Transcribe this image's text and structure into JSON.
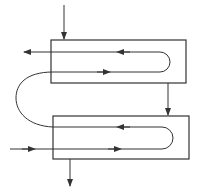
{
  "diagram": {
    "type": "two-pass U-tube heat exchanger flow schematic",
    "stroke_color": "#333333",
    "background": "#ffffff",
    "units": [
      {
        "name": "upper-exchanger-shell",
        "x": 51,
        "y": 40,
        "w": 135,
        "h": 43
      },
      {
        "name": "lower-exchanger-shell",
        "x": 53,
        "y": 116,
        "w": 136,
        "h": 43
      }
    ],
    "streams": [
      {
        "name": "shell-inlet-top",
        "direction": "down"
      },
      {
        "name": "tube-outlet-top",
        "direction": "left"
      },
      {
        "name": "crossover-shell",
        "direction": "down"
      },
      {
        "name": "tube-crossover-curve",
        "direction": "up"
      },
      {
        "name": "tube-inlet-bottom",
        "direction": "right"
      },
      {
        "name": "shell-outlet-bottom",
        "direction": "down"
      }
    ],
    "labels": []
  }
}
